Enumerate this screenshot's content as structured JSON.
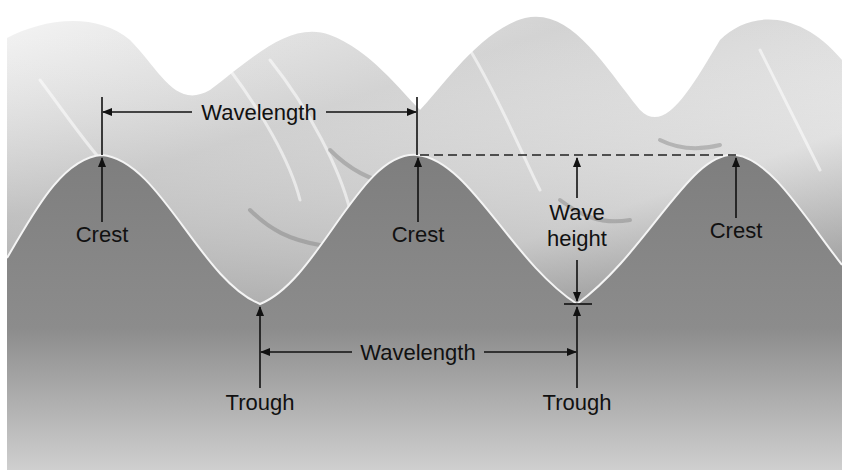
{
  "diagram": {
    "labels": {
      "wavelength_top": "Wavelength",
      "wavelength_bottom": "Wavelength",
      "crest_1": "Crest",
      "crest_2": "Crest",
      "crest_3": "Crest",
      "trough_1": "Trough",
      "trough_2": "Trough",
      "wave_height_line1": "Wave",
      "wave_height_line2": "height"
    },
    "colors": {
      "background": "#ffffff",
      "sea_fill": "#8a8a8a",
      "wave_surface_light": "#e4e4e4",
      "wave_surface_mid": "#b4b4b4",
      "profile_line": "#f2f2f2",
      "annotation": "#111111"
    },
    "geometry": {
      "crest_x": [
        102,
        417,
        736
      ],
      "crest_y": 155,
      "trough_x": [
        260,
        577
      ],
      "trough_y": 304
    }
  }
}
